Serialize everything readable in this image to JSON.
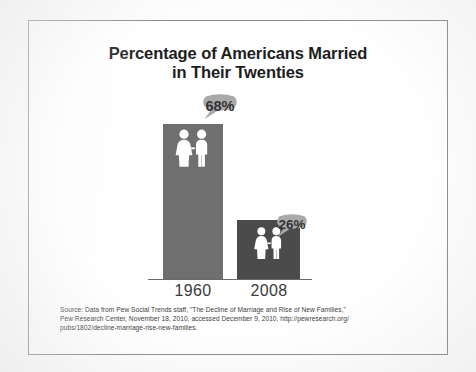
{
  "figure": {
    "title_line_1": "Percentage of Americans Married",
    "title_line_2": "in Their Twenties",
    "source_line_1": "Source: Data from Pew Social Trends staff, \"The Decline of Marriage and Rise of New Families,\"",
    "source_line_2": "Pew Research Center, November 18, 2010, accessed December 9, 2010, http://pewresearch.org/",
    "source_line_3": "pubs/1802/decline-marriage-rise-new-families."
  },
  "colors": {
    "bar_1960": "#6f6f6f",
    "bar_2008": "#4b4b4b",
    "bubble_fill": "#a9a9a9",
    "pictogram": "#ffffff",
    "frame": "#8d8d91",
    "title_text": "#1d1d1d"
  },
  "labels": {
    "bubble_1960": "68%",
    "bubble_2008": "26%",
    "x_1960": "1960",
    "x_2008": "2008"
  },
  "icons": {
    "couple_1960": "couple-pictogram-icon",
    "couple_2008": "couple-pictogram-icon",
    "bubble_1960": "speech-bubble-icon",
    "bubble_2008": "speech-bubble-icon"
  },
  "chart_data": {
    "type": "bar",
    "title": "Percentage of Americans Married in Their Twenties",
    "subtitle": "",
    "xlabel": "",
    "ylabel": "",
    "categories": [
      "1960",
      "2008"
    ],
    "values": [
      68,
      26
    ],
    "value_labels": [
      "68%",
      "26%"
    ],
    "unit": "percent",
    "ylim": [
      0,
      100
    ],
    "grid": false,
    "legend": false,
    "axis": "baseline only, no y-axis ticks",
    "series": [
      {
        "name": "Percentage married in their twenties",
        "values": [
          68,
          26
        ]
      }
    ],
    "annotations": [
      {
        "text": "68%",
        "attached_to": "1960",
        "style": "speech-bubble"
      },
      {
        "text": "26%",
        "attached_to": "2008",
        "style": "speech-bubble"
      }
    ],
    "source": "Data from Pew Social Trends staff, \"The Decline of Marriage and Rise of New Families,\" Pew Research Center, November 18, 2010, accessed December 9, 2010, http://pewresearch.org/pubs/1802/decline-marriage-rise-new-families."
  }
}
